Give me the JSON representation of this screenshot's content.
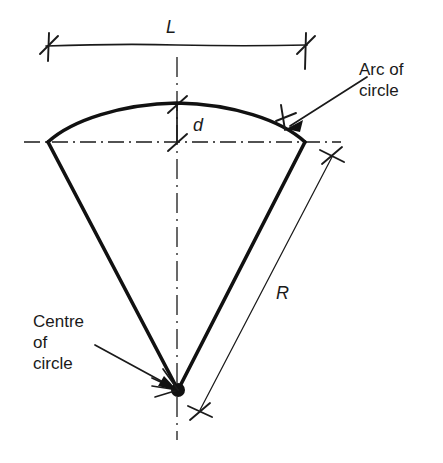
{
  "figure": {
    "background_color": "#ffffff",
    "line_color": "#1a1a1a"
  },
  "labels": {
    "chord_length": "L",
    "mid_ordinate": "d",
    "radius": "R",
    "arc_of_circle_line1": "Arc of",
    "arc_of_circle_line2": "circle",
    "centre_of_circle_line1": "Centre",
    "centre_of_circle_line2": "of",
    "centre_of_circle_line3": "circle"
  },
  "geometry": {
    "centre_point": {
      "x": 178,
      "y": 390
    },
    "left_vertex": {
      "x": 48,
      "y": 142
    },
    "right_vertex": {
      "x": 305,
      "y": 142
    },
    "arc_apex": {
      "x": 177,
      "y": 103
    },
    "vertical_centerline_x": 177,
    "horizontal_centerline_y": 142,
    "chord_dimension_line_y": 45,
    "chord_dimension_left_x": 48,
    "chord_dimension_right_x": 305,
    "mid_ordinate_top_y": 103,
    "mid_ordinate_bottom_y": 142,
    "radius_dim_top": {
      "x": 332,
      "y": 155
    },
    "radius_dim_bottom": {
      "x": 200,
      "y": 412
    }
  },
  "annotations": [
    {
      "name": "chord-length-L",
      "symbol": "L",
      "meaning": "chord length across the arc"
    },
    {
      "name": "mid-ordinate-d",
      "symbol": "d",
      "meaning": "rise / mid-ordinate from chord to arc"
    },
    {
      "name": "radius-R",
      "symbol": "R",
      "meaning": "radius of the circle"
    },
    {
      "name": "arc-of-circle",
      "symbol": "Arc of circle",
      "meaning": "the curved top boundary"
    },
    {
      "name": "centre-of-circle",
      "symbol": "Centre of circle",
      "meaning": "apex point where radii meet"
    }
  ]
}
